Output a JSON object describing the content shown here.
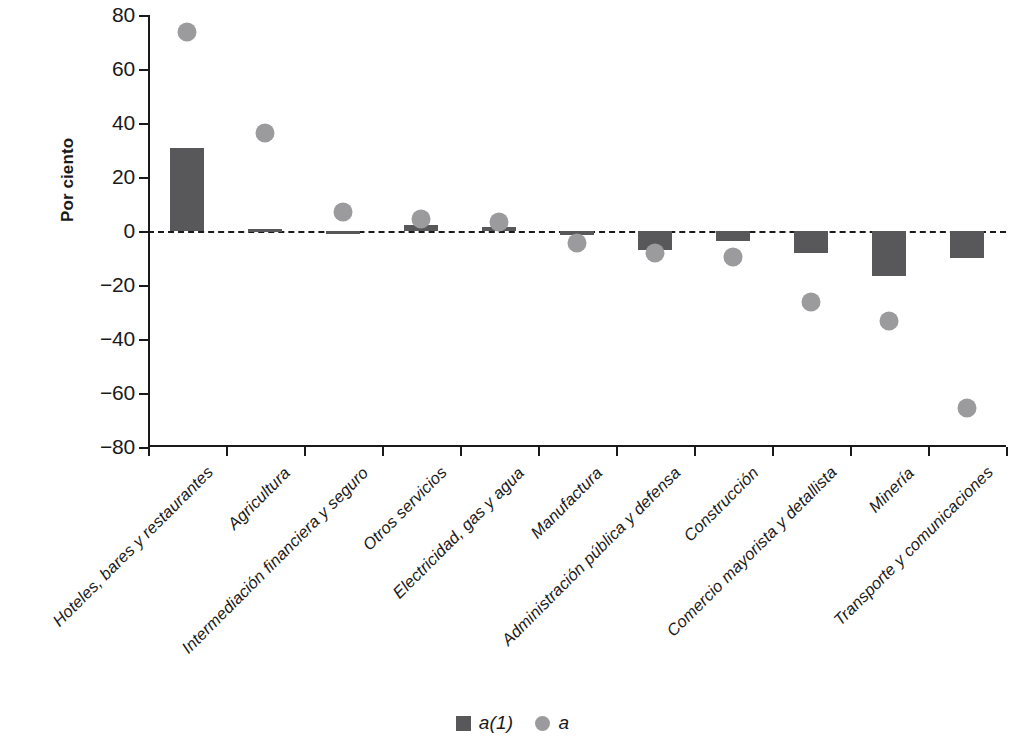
{
  "chart_data": {
    "type": "bar",
    "title": "",
    "subtitle": "",
    "xlabel": "",
    "ylabel": "Por ciento",
    "ylim": [
      -80,
      80
    ],
    "yticks": [
      80,
      60,
      40,
      20,
      0,
      -20,
      -40,
      -60,
      -80
    ],
    "ytick_labels": [
      "80",
      "60",
      "40",
      "20",
      "0",
      "−20",
      "−40",
      "−60",
      "−80"
    ],
    "grid": false,
    "zero_line": true,
    "legend_position": "bottom",
    "categories": [
      "Hoteles, bares y restaurantes",
      "Agricultura",
      "Intermediación financiera y seguro",
      "Otros servicios",
      "Electricidad, gas y agua",
      "Manufactura",
      "Administración pública y defensa",
      "Construcción",
      "Comercio mayorista y detallista",
      "Minería",
      "Transporte y comunicaciones"
    ],
    "series": [
      {
        "name": "a(1)",
        "type": "bar",
        "color": "#58585a",
        "values": [
          30.7,
          0.6,
          -0.6,
          2.4,
          1.5,
          -1.6,
          -7.0,
          -3.7,
          -8.0,
          -16.7,
          -10.0
        ]
      },
      {
        "name": "a",
        "type": "scatter",
        "color": "#9b9b9d",
        "values": [
          73.7,
          36.3,
          7.0,
          4.6,
          3.3,
          -4.4,
          -8.2,
          -9.6,
          -26.3,
          -33.5,
          -65.5
        ]
      }
    ]
  },
  "legend": {
    "items": [
      {
        "label": "a(1)",
        "marker": "square"
      },
      {
        "label": "a",
        "marker": "circle"
      }
    ]
  }
}
